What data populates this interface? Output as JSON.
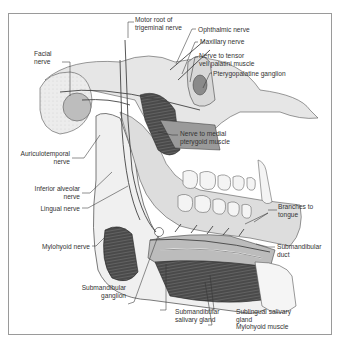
{
  "figure": {
    "border_color": "#9a9a9a",
    "labels": {
      "motor_root": [
        "Motor root of",
        "trigeminal nerve"
      ],
      "ophthalmic": "Ophthalmic nerve",
      "maxillary": "Maxillary nerve",
      "tensor": [
        "Nerve to tensor",
        "veli palatini muscle"
      ],
      "pterygopalatine": "Pterygopalatine ganglion",
      "facial": [
        "Facial",
        "nerve"
      ],
      "medial_pterygoid": [
        "Nerve to medial",
        "pterygoid muscle"
      ],
      "auriculotemporal": [
        "Auriculotemporal",
        "nerve"
      ],
      "inferior_alveolar": [
        "Inferior alveolar",
        "nerve"
      ],
      "lingual": "Lingual nerve",
      "branches_tongue": [
        "Branches to",
        "tongue"
      ],
      "mylohyoid_nerve": "Mylohyoid nerve",
      "submandibular_duct": [
        "Submandibular",
        "duct"
      ],
      "submandibular_ganglion": [
        "Submandibular",
        "ganglion"
      ],
      "submandibular_gland": [
        "Submandibular",
        "salivary gland"
      ],
      "sublingual_gland": [
        "Sublingual salivary",
        "gland"
      ],
      "mylohyoid_muscle": "Mylohyoid muscle"
    }
  }
}
